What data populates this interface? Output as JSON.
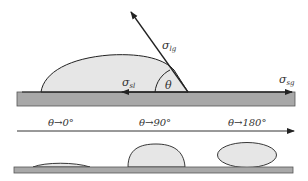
{
  "figure": {
    "colors": {
      "substrate_fill": "#a8a8a8",
      "substrate_stroke": "#555555",
      "drop_fill": "#e6e6e6",
      "line": "#222222",
      "text": "#333333",
      "background": "#ffffff"
    },
    "top_panel": {
      "forces": [
        {
          "id": "lg",
          "symbol": "σ",
          "subscript": "lg",
          "direction": "up-left along liquid-gas interface"
        },
        {
          "id": "sl",
          "symbol": "σ",
          "subscript": "sl",
          "direction": "left along solid-liquid interface"
        },
        {
          "id": "sg",
          "symbol": "σ",
          "subscript": "sg",
          "direction": "right along solid-gas interface"
        }
      ],
      "angle_label": "θ"
    },
    "scale": {
      "labels": [
        {
          "text": "θ→0°"
        },
        {
          "text": "θ→90°"
        },
        {
          "text": "θ→180°"
        }
      ]
    },
    "bottom_panel": {
      "drops": [
        {
          "case": "θ→0°",
          "shape": "thin spreading cap"
        },
        {
          "case": "θ→90°",
          "shape": "hemispherical cap"
        },
        {
          "case": "θ→180°",
          "shape": "near-spherical drop resting on surface"
        }
      ]
    }
  },
  "labels": {
    "sigma": "σ",
    "sub_lg": "lg",
    "sub_sl": "sl",
    "sub_sg": "sg",
    "theta": "θ",
    "tick_0": "θ→0°",
    "tick_90": "θ→90°",
    "tick_180": "θ→180°"
  }
}
